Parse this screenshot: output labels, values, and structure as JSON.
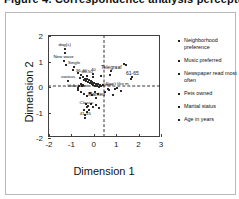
{
  "title": {
    "text": "Figure 4. Correspondence analysis perceptual map"
  },
  "chart_data": {
    "type": "scatter",
    "title": "",
    "xlabel": "Dimension 1",
    "ylabel": "Dimension 2",
    "xlim": [
      -2,
      3
    ],
    "ylim": [
      -2,
      2
    ],
    "xticks": [
      "-2",
      "-1",
      "0",
      "1",
      "2",
      "3"
    ],
    "yticks": [
      "2",
      "1",
      "0",
      "-1",
      "-2"
    ],
    "xtick_values": [
      -2,
      -1,
      0,
      1,
      2,
      3
    ],
    "ytick_values": [
      2,
      1,
      0,
      -1,
      -2
    ],
    "grid": false,
    "reference_lines": {
      "vertical_x": 0,
      "horizontal_y": 0,
      "style": "dashed"
    },
    "legend_position": "right",
    "legend": [
      "Neighborhood preference",
      "Music preferred",
      "Newspaper read most often",
      "Pets owned",
      "Marital status",
      "Age in years"
    ],
    "labeled_points": [
      {
        "label": "dog(s)",
        "x": -1.3,
        "y": 1.48
      },
      {
        "label": "New wave",
        "x": -1.35,
        "y": 1.02
      },
      {
        "label": "Single",
        "x": -0.88,
        "y": 0.78
      },
      {
        "label": "various",
        "x": -1.15,
        "y": 0.22
      },
      {
        "label": "36-40",
        "x": -0.55,
        "y": 0.48
      },
      {
        "label": "46-50",
        "x": -0.3,
        "y": 0.45
      },
      {
        "label": "40",
        "x": -0.02,
        "y": 0.5
      },
      {
        "label": "Telegraaf",
        "x": 0.78,
        "y": 0.62
      },
      {
        "label": "Volkskrant",
        "x": -0.72,
        "y": -0.12
      },
      {
        "label": "Married",
        "x": 0.12,
        "y": -0.42
      },
      {
        "label": "61-65",
        "x": 1.72,
        "y": 0.38
      },
      {
        "label": "41-45",
        "x": -0.38,
        "y": -1.22
      },
      {
        "label": "Classic",
        "x": -0.32,
        "y": -0.8
      },
      {
        "label": "Don't like m",
        "x": 1.05,
        "y": -0.02
      },
      {
        "label": "Other",
        "x": 0.62,
        "y": -0.08
      }
    ],
    "unlabeled_points": [
      {
        "x": -1.28,
        "y": 1.32
      },
      {
        "x": -1.22,
        "y": 0.88
      },
      {
        "x": -0.92,
        "y": 0.66
      },
      {
        "x": -0.72,
        "y": 0.56
      },
      {
        "x": -0.6,
        "y": 0.36
      },
      {
        "x": -0.48,
        "y": 0.4
      },
      {
        "x": -0.44,
        "y": 0.28
      },
      {
        "x": -0.38,
        "y": 0.32
      },
      {
        "x": -0.34,
        "y": 0.22
      },
      {
        "x": -0.3,
        "y": 0.3
      },
      {
        "x": -0.26,
        "y": 0.18
      },
      {
        "x": -0.22,
        "y": 0.26
      },
      {
        "x": -0.18,
        "y": 0.14
      },
      {
        "x": -0.14,
        "y": 0.22
      },
      {
        "x": -0.1,
        "y": 0.1
      },
      {
        "x": -0.06,
        "y": 0.2
      },
      {
        "x": -0.02,
        "y": 0.06
      },
      {
        "x": 0.02,
        "y": 0.16
      },
      {
        "x": 0.06,
        "y": 0.04
      },
      {
        "x": 0.1,
        "y": 0.12
      },
      {
        "x": 0.14,
        "y": 0.02
      },
      {
        "x": 0.18,
        "y": 0.1
      },
      {
        "x": 0.22,
        "y": 0.0
      },
      {
        "x": 0.28,
        "y": 0.08
      },
      {
        "x": 0.34,
        "y": 0.02
      },
      {
        "x": 0.4,
        "y": 0.06
      },
      {
        "x": -0.46,
        "y": 0.08
      },
      {
        "x": -0.52,
        "y": 0.02
      },
      {
        "x": -0.58,
        "y": 0.12
      },
      {
        "x": -0.64,
        "y": 0.04
      },
      {
        "x": -0.7,
        "y": -0.04
      },
      {
        "x": -0.56,
        "y": -0.18
      },
      {
        "x": -0.42,
        "y": -0.26
      },
      {
        "x": -0.3,
        "y": -0.34
      },
      {
        "x": -0.18,
        "y": -0.22
      },
      {
        "x": -0.06,
        "y": -0.3
      },
      {
        "x": 0.06,
        "y": -0.2
      },
      {
        "x": 0.18,
        "y": -0.28
      },
      {
        "x": -0.36,
        "y": -0.68
      },
      {
        "x": -0.24,
        "y": -0.74
      },
      {
        "x": -0.12,
        "y": -0.66
      },
      {
        "x": -0.02,
        "y": -0.78
      },
      {
        "x": 0.1,
        "y": -0.7
      },
      {
        "x": 0.22,
        "y": -0.82
      },
      {
        "x": -0.44,
        "y": -0.92
      },
      {
        "x": -0.32,
        "y": -0.98
      },
      {
        "x": -0.2,
        "y": -0.9
      },
      {
        "x": -0.4,
        "y": -1.08
      },
      {
        "x": 0.52,
        "y": -0.18
      },
      {
        "x": 0.68,
        "y": -0.12
      },
      {
        "x": 0.86,
        "y": -0.3
      },
      {
        "x": 0.94,
        "y": -0.06
      },
      {
        "x": 1.22,
        "y": -0.14
      },
      {
        "x": 1.42,
        "y": 0.86
      },
      {
        "x": 1.34,
        "y": 0.92
      },
      {
        "x": 0.74,
        "y": 0.48
      },
      {
        "x": 1.68,
        "y": 0.3
      },
      {
        "x": 0.3,
        "y": 0.44
      },
      {
        "x": -0.02,
        "y": 0.4
      },
      {
        "x": -0.56,
        "y": 0.46
      }
    ]
  }
}
